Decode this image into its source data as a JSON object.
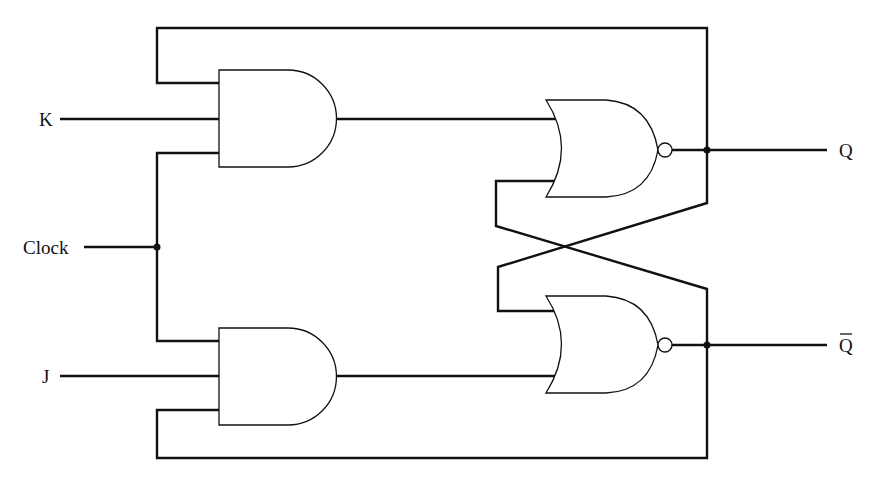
{
  "diagram": {
    "type": "JK flip-flop logic circuit",
    "inputs": [
      {
        "id": "K",
        "label": "K"
      },
      {
        "id": "clock",
        "label": "Clock"
      },
      {
        "id": "J",
        "label": "J"
      }
    ],
    "outputs": [
      {
        "id": "Q",
        "label": "Q"
      },
      {
        "id": "Qbar",
        "label": "Q̅"
      }
    ],
    "gates": [
      {
        "id": "and-upper",
        "kind": "AND",
        "inputs": [
          "Q feedback",
          "K",
          "Clock"
        ],
        "output": "nor-upper"
      },
      {
        "id": "and-lower",
        "kind": "AND",
        "inputs": [
          "Clock",
          "J",
          "Q-bar feedback"
        ],
        "output": "nor-lower"
      },
      {
        "id": "nor-upper",
        "kind": "NOR",
        "inputs": [
          "and-upper",
          "Q-bar (cross-coupled)"
        ],
        "output": "Q"
      },
      {
        "id": "nor-lower",
        "kind": "NOR",
        "inputs": [
          "Q (cross-coupled)",
          "and-lower"
        ],
        "output": "Q-bar"
      }
    ],
    "colors": {
      "line": "#111111",
      "background": "#ffffff"
    }
  }
}
